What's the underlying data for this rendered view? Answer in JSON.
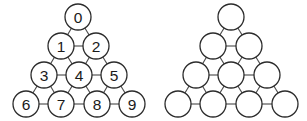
{
  "figure": {
    "canvas": {
      "width": 307,
      "height": 121,
      "background": "#ffffff"
    },
    "style": {
      "node_fill": "#ffffff",
      "node_stroke": "#2b2b2b",
      "node_radius": 13,
      "edge_color": "#4d4d4d",
      "label_color": "#1a1a1a"
    },
    "panels": [
      {
        "id": "labeled-triangle-graph",
        "name": "left-graph-labeled",
        "labels_visible": true,
        "nodes": [
          {
            "id": "n0",
            "label": "0",
            "x": 78,
            "y": 17,
            "row": 0,
            "col": 0
          },
          {
            "id": "n1",
            "label": "1",
            "x": 61,
            "y": 46,
            "row": 1,
            "col": 0
          },
          {
            "id": "n2",
            "label": "2",
            "x": 96,
            "y": 46,
            "row": 1,
            "col": 1
          },
          {
            "id": "n3",
            "label": "3",
            "x": 44,
            "y": 75,
            "row": 2,
            "col": 0
          },
          {
            "id": "n4",
            "label": "4",
            "x": 79,
            "y": 75,
            "row": 2,
            "col": 1
          },
          {
            "id": "n5",
            "label": "5",
            "x": 114,
            "y": 75,
            "row": 2,
            "col": 2
          },
          {
            "id": "n6",
            "label": "6",
            "x": 26,
            "y": 104,
            "row": 3,
            "col": 0
          },
          {
            "id": "n7",
            "label": "7",
            "x": 61,
            "y": 104,
            "row": 3,
            "col": 1
          },
          {
            "id": "n8",
            "label": "8",
            "x": 97,
            "y": 104,
            "row": 3,
            "col": 2
          },
          {
            "id": "n9",
            "label": "9",
            "x": 132,
            "y": 104,
            "row": 3,
            "col": 3
          }
        ],
        "edges": [
          [
            "n0",
            "n1"
          ],
          [
            "n0",
            "n2"
          ],
          [
            "n1",
            "n2"
          ],
          [
            "n1",
            "n3"
          ],
          [
            "n1",
            "n4"
          ],
          [
            "n2",
            "n4"
          ],
          [
            "n2",
            "n5"
          ],
          [
            "n3",
            "n4"
          ],
          [
            "n4",
            "n5"
          ],
          [
            "n3",
            "n6"
          ],
          [
            "n3",
            "n7"
          ],
          [
            "n4",
            "n7"
          ],
          [
            "n4",
            "n8"
          ],
          [
            "n5",
            "n8"
          ],
          [
            "n5",
            "n9"
          ],
          [
            "n6",
            "n7"
          ],
          [
            "n7",
            "n8"
          ],
          [
            "n8",
            "n9"
          ]
        ]
      },
      {
        "id": "unlabeled-triangle-graph",
        "name": "right-graph-unlabeled",
        "labels_visible": false,
        "nodes": [
          {
            "id": "m0",
            "label": "",
            "x": 231,
            "y": 17,
            "row": 0,
            "col": 0
          },
          {
            "id": "m1",
            "label": "",
            "x": 213,
            "y": 46,
            "row": 1,
            "col": 0
          },
          {
            "id": "m2",
            "label": "",
            "x": 249,
            "y": 46,
            "row": 1,
            "col": 1
          },
          {
            "id": "m3",
            "label": "",
            "x": 196,
            "y": 75,
            "row": 2,
            "col": 0
          },
          {
            "id": "m4",
            "label": "",
            "x": 231,
            "y": 75,
            "row": 2,
            "col": 1
          },
          {
            "id": "m5",
            "label": "",
            "x": 267,
            "y": 75,
            "row": 2,
            "col": 2
          },
          {
            "id": "m6",
            "label": "",
            "x": 178,
            "y": 104,
            "row": 3,
            "col": 0
          },
          {
            "id": "m7",
            "label": "",
            "x": 213,
            "y": 104,
            "row": 3,
            "col": 1
          },
          {
            "id": "m8",
            "label": "",
            "x": 249,
            "y": 104,
            "row": 3,
            "col": 2
          },
          {
            "id": "m9",
            "label": "",
            "x": 285,
            "y": 104,
            "row": 3,
            "col": 3
          }
        ],
        "edges": [
          [
            "m0",
            "m1"
          ],
          [
            "m0",
            "m2"
          ],
          [
            "m1",
            "m2"
          ],
          [
            "m1",
            "m3"
          ],
          [
            "m1",
            "m4"
          ],
          [
            "m2",
            "m4"
          ],
          [
            "m2",
            "m5"
          ],
          [
            "m3",
            "m4"
          ],
          [
            "m4",
            "m5"
          ],
          [
            "m3",
            "m6"
          ],
          [
            "m3",
            "m7"
          ],
          [
            "m4",
            "m7"
          ],
          [
            "m4",
            "m8"
          ],
          [
            "m5",
            "m8"
          ],
          [
            "m5",
            "m9"
          ],
          [
            "m6",
            "m7"
          ],
          [
            "m7",
            "m8"
          ],
          [
            "m8",
            "m9"
          ]
        ]
      }
    ]
  }
}
